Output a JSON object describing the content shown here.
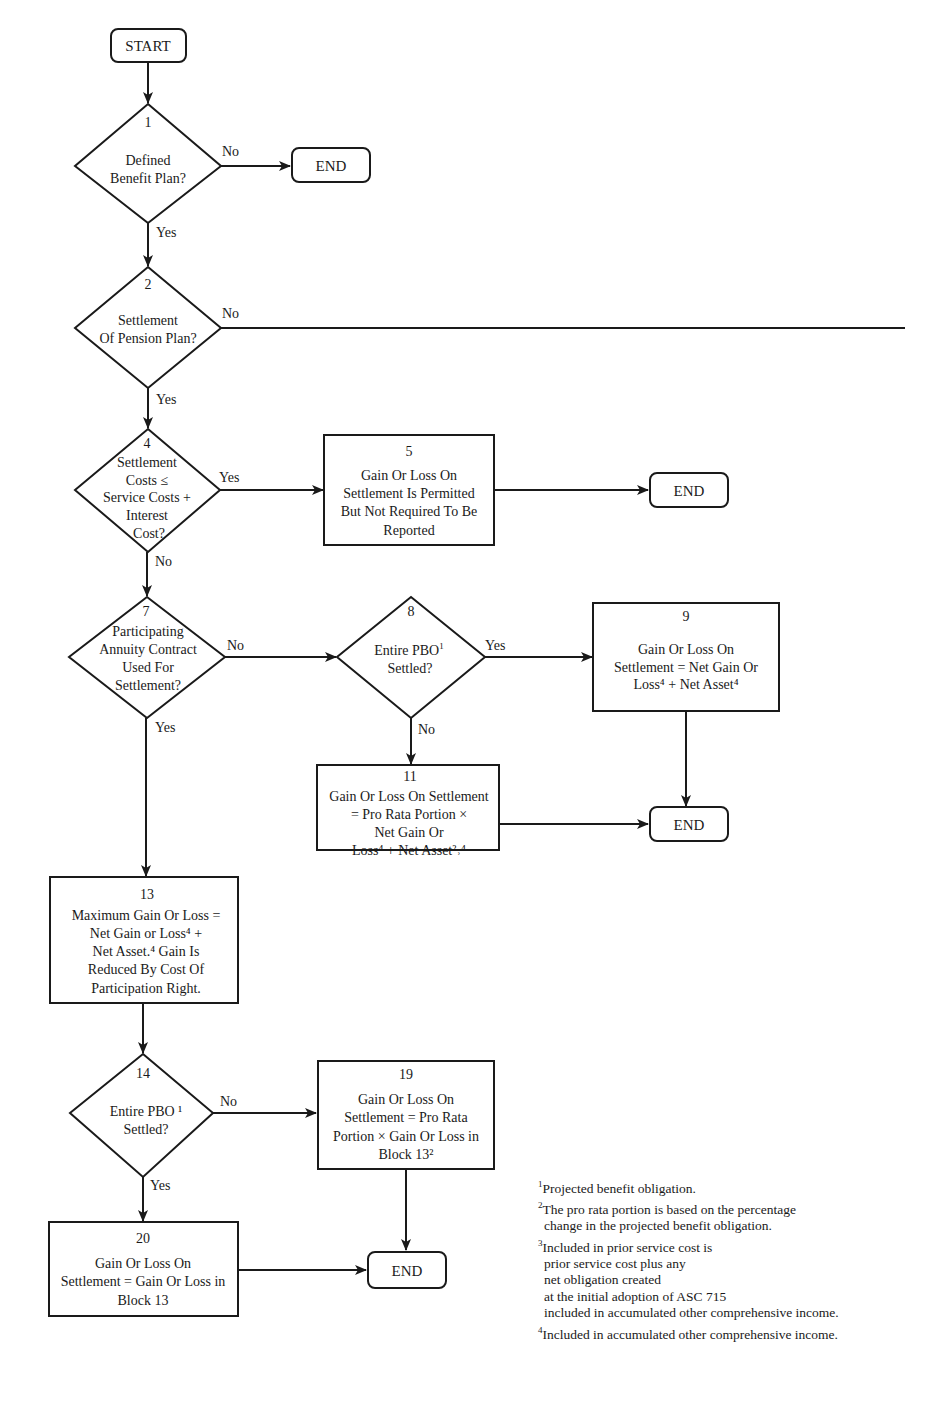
{
  "diagram": {
    "terminals": {
      "start": "START",
      "end": "END"
    },
    "edge_labels": {
      "yes": "Yes",
      "no": "No"
    },
    "nodes": {
      "n1": {
        "number": "1",
        "lines": [
          "Defined",
          "Benefit Plan?"
        ]
      },
      "n2": {
        "number": "2",
        "lines": [
          "Settlement",
          "Of Pension Plan?"
        ]
      },
      "n4": {
        "number": "4",
        "lines": [
          "Settlement",
          "Costs ≤",
          "Service Costs +",
          "Interest",
          "Cost?"
        ]
      },
      "n5": {
        "number": "5",
        "lines": [
          "Gain Or Loss On",
          "Settlement Is Permitted",
          "But Not Required To Be",
          "Reported"
        ]
      },
      "n7": {
        "number": "7",
        "lines": [
          "Participating",
          "Annuity Contract",
          "Used For",
          "Settlement?"
        ]
      },
      "n8": {
        "number": "8",
        "lines": [
          "Entire PBO",
          "Settled?"
        ],
        "sup": "1"
      },
      "n9": {
        "number": "9",
        "lines": [
          "Gain Or Loss On",
          "Settlement = Net Gain Or",
          "Loss⁴ + Net Asset⁴"
        ]
      },
      "n11": {
        "number": "11",
        "lines": [
          "Gain Or Loss On Settlement",
          "= Pro Rata Portion ×",
          "Net Gain Or",
          "Loss⁴ + Net Asset²˒⁴"
        ]
      },
      "n13": {
        "number": "13",
        "lines": [
          "Maximum Gain Or Loss =",
          "Net Gain or Loss⁴ +",
          "Net Asset.⁴ Gain Is",
          "Reduced By Cost Of",
          "Participation Right."
        ]
      },
      "n14": {
        "number": "14",
        "lines": [
          "Entire PBO ¹",
          "Settled?"
        ]
      },
      "n19": {
        "number": "19",
        "lines": [
          "Gain Or Loss On",
          "Settlement = Pro Rata",
          "Portion × Gain Or Loss in",
          "Block 13²"
        ]
      },
      "n20": {
        "number": "20",
        "lines": [
          "Gain Or Loss On",
          "Settlement = Gain Or Loss in",
          "Block 13"
        ]
      }
    },
    "edges": [
      {
        "from": "start",
        "to": "n1"
      },
      {
        "from": "n1",
        "to": "end",
        "label": "No"
      },
      {
        "from": "n1",
        "to": "n2",
        "label": "Yes"
      },
      {
        "from": "n2",
        "to": "off-page",
        "label": "No"
      },
      {
        "from": "n2",
        "to": "n4",
        "label": "Yes"
      },
      {
        "from": "n4",
        "to": "n5",
        "label": "Yes"
      },
      {
        "from": "n5",
        "to": "end"
      },
      {
        "from": "n4",
        "to": "n7",
        "label": "No"
      },
      {
        "from": "n7",
        "to": "n8",
        "label": "No"
      },
      {
        "from": "n7",
        "to": "n13",
        "label": "Yes"
      },
      {
        "from": "n8",
        "to": "n9",
        "label": "Yes"
      },
      {
        "from": "n8",
        "to": "n11",
        "label": "No"
      },
      {
        "from": "n9",
        "to": "end"
      },
      {
        "from": "n11",
        "to": "end"
      },
      {
        "from": "n13",
        "to": "n14"
      },
      {
        "from": "n14",
        "to": "n19",
        "label": "No"
      },
      {
        "from": "n14",
        "to": "n20",
        "label": "Yes"
      },
      {
        "from": "n19",
        "to": "end"
      },
      {
        "from": "n20",
        "to": "end"
      }
    ],
    "footnotes": [
      {
        "mark": "1",
        "lines": [
          "Projected benefit obligation."
        ]
      },
      {
        "mark": "2",
        "lines": [
          "The pro rata portion is based on the percentage",
          "change in the projected benefit obligation."
        ]
      },
      {
        "mark": "3",
        "lines": [
          "Included in prior service cost is",
          "prior service cost plus any",
          "net obligation created",
          "at the initial adoption of ASC 715",
          "included in accumulated other comprehensive income."
        ]
      },
      {
        "mark": "4",
        "lines": [
          "Included in accumulated other comprehensive income."
        ]
      }
    ]
  }
}
